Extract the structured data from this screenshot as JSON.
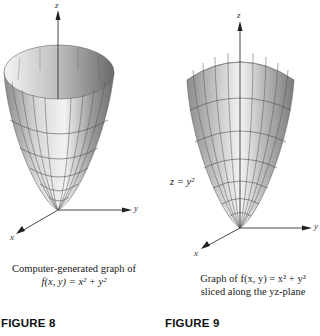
{
  "figures": [
    {
      "id": "figure-8",
      "title": "FIGURE 8",
      "caption_line1": "Computer-generated graph of",
      "caption_line2": "f(x, y) = x² + y²",
      "axes": {
        "z": "z",
        "y": "y",
        "x": "x"
      }
    },
    {
      "id": "figure-9",
      "title": "FIGURE 9",
      "caption_line1": "Graph of f(x, y) = x² + y²",
      "caption_line2": "sliced along the yz-plane",
      "annotation": "z = y²",
      "axes": {
        "z": "z",
        "y": "y",
        "x": "x"
      }
    }
  ]
}
